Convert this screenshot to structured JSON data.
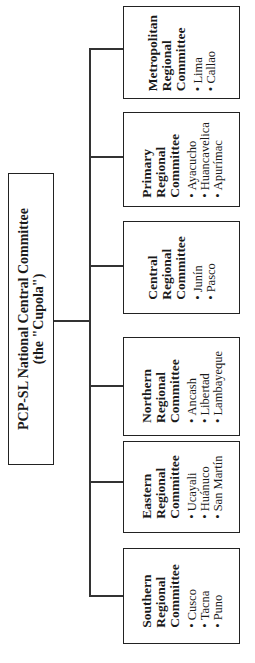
{
  "root": {
    "title": "PCP-SL National Central Committee",
    "subtitle": "(the \"Cupola\")"
  },
  "committees": [
    {
      "name_lines": [
        "Metropolitan",
        "Regional",
        "Committee"
      ],
      "items": [
        "Lima",
        "Callao"
      ]
    },
    {
      "name_lines": [
        "Primary",
        "Regional",
        "Committee"
      ],
      "items": [
        "Ayacucho",
        "Huancavelica",
        "Apurímac"
      ]
    },
    {
      "name_lines": [
        "Central",
        "Regional",
        "Committee"
      ],
      "items": [
        "Junín",
        "Pasco"
      ]
    },
    {
      "name_lines": [
        "Northern",
        "Regional",
        "Committee"
      ],
      "items": [
        "Ancash",
        "Libertad",
        "Lambayeque"
      ]
    },
    {
      "name_lines": [
        "Eastern",
        "Regional",
        "Committee"
      ],
      "items": [
        "Ucayali",
        "Huánuco",
        "San Martín"
      ]
    },
    {
      "name_lines": [
        "Southern",
        "Regional",
        "Committee"
      ],
      "items": [
        "Cusco",
        "Tacna",
        "Puno"
      ]
    }
  ],
  "colors": {
    "line": "#333333",
    "border": "#222222",
    "background": "#ffffff"
  }
}
